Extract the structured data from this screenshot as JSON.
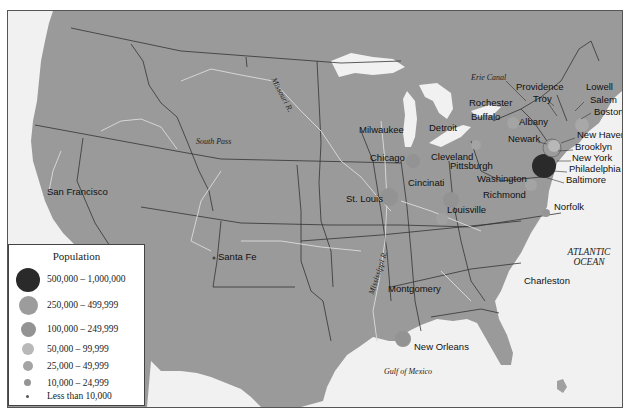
{
  "map": {
    "legend": {
      "title": "Population",
      "items": [
        {
          "label": "500,000 – 1,000,000",
          "color": "#2a2a2a",
          "size": 24
        },
        {
          "label": "250,000 – 499,999",
          "color": "#9c9c9c",
          "size": 19
        },
        {
          "label": "100,000 – 249,999",
          "color": "#939393",
          "size": 15
        },
        {
          "label": "50,000 – 99,999",
          "color": "#b8b8b8",
          "size": 12
        },
        {
          "label": "25,000 – 49,999",
          "color": "#a4a4a4",
          "size": 10
        },
        {
          "label": "10,000 – 24,999",
          "color": "#959595",
          "size": 7
        },
        {
          "label": "Less than 10,000",
          "color": "#555555",
          "size": 3
        }
      ]
    },
    "cities": [
      {
        "name": "San Francisco",
        "x": 46,
        "y": 192
      },
      {
        "name": "Santa Fe",
        "x": 217,
        "y": 256
      },
      {
        "name": "Milwaukee",
        "x": 358,
        "y": 129
      },
      {
        "name": "Chicago",
        "x": 369,
        "y": 157
      },
      {
        "name": "Detroit",
        "x": 428,
        "y": 127
      },
      {
        "name": "Cleveland",
        "x": 430,
        "y": 157
      },
      {
        "name": "Pittsburgh",
        "x": 449,
        "y": 165
      },
      {
        "name": "Cincinati",
        "x": 407,
        "y": 182
      },
      {
        "name": "St. Louis",
        "x": 345,
        "y": 198
      },
      {
        "name": "Louisville",
        "x": 446,
        "y": 209
      },
      {
        "name": "Rochester",
        "x": 468,
        "y": 102
      },
      {
        "name": "Buffalo",
        "x": 468,
        "y": 116
      },
      {
        "name": "Albany",
        "x": 518,
        "y": 121
      },
      {
        "name": "Providence",
        "x": 515,
        "y": 86
      },
      {
        "name": "Troy",
        "x": 532,
        "y": 98
      },
      {
        "name": "Lowell",
        "x": 585,
        "y": 86
      },
      {
        "name": "Salem",
        "x": 589,
        "y": 99
      },
      {
        "name": "Boston",
        "x": 593,
        "y": 111
      },
      {
        "name": "Newark",
        "x": 507,
        "y": 138
      },
      {
        "name": "New Haven",
        "x": 576,
        "y": 134
      },
      {
        "name": "Brooklyn",
        "x": 574,
        "y": 146
      },
      {
        "name": "New York",
        "x": 571,
        "y": 157
      },
      {
        "name": "Philadelphia",
        "x": 568,
        "y": 168
      },
      {
        "name": "Baltimore",
        "x": 565,
        "y": 179
      },
      {
        "name": "Washington",
        "x": 476,
        "y": 178
      },
      {
        "name": "Richmond",
        "x": 482,
        "y": 194
      },
      {
        "name": "Norfolk",
        "x": 553,
        "y": 206
      },
      {
        "name": "Montgomery",
        "x": 387,
        "y": 288
      },
      {
        "name": "Charleston",
        "x": 523,
        "y": 280
      },
      {
        "name": "New Orleans",
        "x": 413,
        "y": 346
      }
    ],
    "features": [
      {
        "name": "Missouri R.",
        "x": 266,
        "y": 70
      },
      {
        "name": "South Pass",
        "x": 195,
        "y": 142
      },
      {
        "name": "Erie Canal",
        "x": 470,
        "y": 76
      },
      {
        "name": "Mississippi R.",
        "x": 375,
        "y": 278
      },
      {
        "name": "Gulf of Mexico",
        "x": 383,
        "y": 372
      }
    ],
    "ocean": {
      "line1": "ATLANTIC",
      "line2": "OCEAN"
    }
  }
}
